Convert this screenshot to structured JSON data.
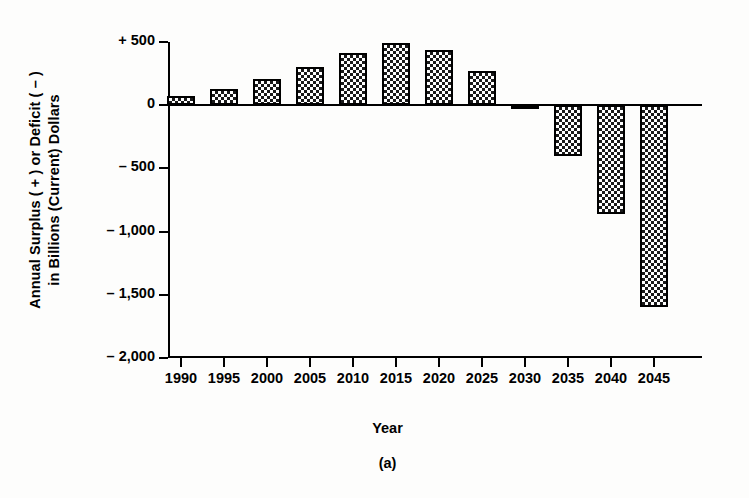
{
  "chart_data": {
    "type": "bar",
    "title": "",
    "subtitle": "",
    "caption": "(a)",
    "xlabel": "Year",
    "ylabel_line1": "Annual Surplus ( + ) or Deficit ( – )",
    "ylabel_line2": "in Billions (Current) Dollars",
    "categories": [
      "1990",
      "1995",
      "2000",
      "2005",
      "2010",
      "2015",
      "2020",
      "2025",
      "2030",
      "2035",
      "2040",
      "2045"
    ],
    "values": [
      75,
      130,
      210,
      300,
      410,
      490,
      440,
      270,
      -10,
      -400,
      -860,
      -1600
    ],
    "ylim": [
      -2000,
      500
    ],
    "xlim_labels": [
      "1990",
      "2045"
    ],
    "ytick_values": [
      500,
      0,
      -500,
      -1000,
      -1500,
      -2000
    ],
    "ytick_labels": [
      "+ 500",
      "0",
      "– 500",
      "– 1,000",
      "– 1,500",
      "– 2,000"
    ],
    "grid": false,
    "legend": false,
    "legend_position": "none",
    "bar_fill": "checkerboard-hatch",
    "bar_border_color": "#000000",
    "axis_color": "#000000",
    "background_color": "#ffffff"
  }
}
